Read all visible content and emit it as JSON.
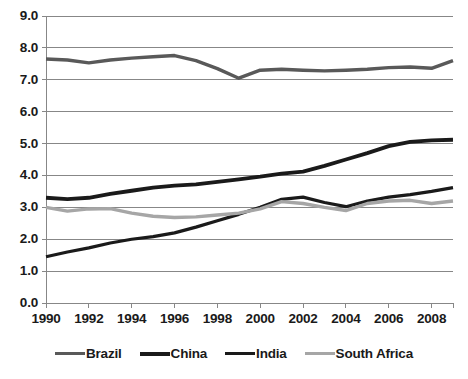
{
  "chart_data": {
    "type": "line",
    "title": "",
    "subtitle": "",
    "xlabel": "",
    "ylabel": "",
    "xlim": [
      1990,
      2009
    ],
    "ylim": [
      0.0,
      9.0
    ],
    "grid": true,
    "legend_position": "bottom",
    "x": [
      1990,
      1991,
      1992,
      1993,
      1994,
      1995,
      1996,
      1997,
      1998,
      1999,
      2000,
      2001,
      2002,
      2003,
      2004,
      2005,
      2006,
      2007,
      2008,
      2009
    ],
    "x_tick_labels": [
      "1990",
      "1992",
      "1994",
      "1996",
      "1998",
      "2000",
      "2002",
      "2004",
      "2006",
      "2008"
    ],
    "x_ticks": [
      1990,
      1992,
      1994,
      1996,
      1998,
      2000,
      2002,
      2004,
      2006,
      2008
    ],
    "y_tick_labels": [
      "0.0",
      "1.0",
      "2.0",
      "3.0",
      "4.0",
      "5.0",
      "6.0",
      "7.0",
      "8.0",
      "9.0"
    ],
    "y_ticks": [
      0.0,
      1.0,
      2.0,
      3.0,
      4.0,
      5.0,
      6.0,
      7.0,
      8.0,
      9.0
    ],
    "series": [
      {
        "name": "Brazil",
        "color": "#595959",
        "width": 3.4,
        "values": [
          7.65,
          7.62,
          7.53,
          7.62,
          7.68,
          7.72,
          7.76,
          7.6,
          7.35,
          7.05,
          7.3,
          7.33,
          7.3,
          7.28,
          7.3,
          7.33,
          7.38,
          7.4,
          7.36,
          7.6
        ]
      },
      {
        "name": "China",
        "color": "#1a1a1a",
        "width": 3.8,
        "values": [
          3.3,
          3.26,
          3.3,
          3.42,
          3.52,
          3.62,
          3.68,
          3.72,
          3.8,
          3.88,
          3.96,
          4.06,
          4.12,
          4.3,
          4.5,
          4.7,
          4.92,
          5.05,
          5.1,
          5.12
        ]
      },
      {
        "name": "India",
        "color": "#1a1a1a",
        "width": 3.2,
        "values": [
          1.45,
          1.6,
          1.73,
          1.88,
          2.0,
          2.08,
          2.2,
          2.38,
          2.58,
          2.78,
          3.0,
          3.25,
          3.32,
          3.15,
          3.02,
          3.2,
          3.32,
          3.4,
          3.5,
          3.62
        ]
      },
      {
        "name": "South Africa",
        "color": "#a6a6a6",
        "width": 3.4,
        "values": [
          3.0,
          2.88,
          2.95,
          2.96,
          2.82,
          2.72,
          2.68,
          2.7,
          2.76,
          2.82,
          2.95,
          3.18,
          3.12,
          3.0,
          2.9,
          3.12,
          3.2,
          3.22,
          3.12,
          3.2
        ]
      }
    ]
  },
  "legend": {
    "items": [
      {
        "label": "Brazil",
        "color": "#595959"
      },
      {
        "label": "China",
        "color": "#1a1a1a"
      },
      {
        "label": "India",
        "color": "#1a1a1a"
      },
      {
        "label": "South Africa",
        "color": "#a6a6a6"
      }
    ]
  },
  "style": {
    "grid_color": "#878787",
    "axis_color": "#878787",
    "background": "#ffffff"
  }
}
